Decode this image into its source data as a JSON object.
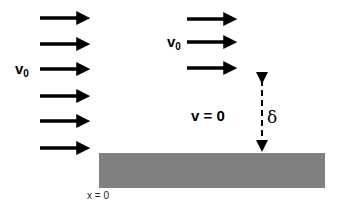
{
  "diagram": {
    "title": "",
    "colors": {
      "arrow": "#000000",
      "plate": "#808080",
      "background": "#ffffff"
    },
    "free_stream_arrows": {
      "left_column": {
        "x_start": 40,
        "x_end": 90,
        "y": [
          18,
          44,
          69,
          96,
          121,
          148
        ]
      },
      "right_column": {
        "x_start": 187,
        "x_end": 237,
        "y": [
          19,
          42,
          68
        ]
      }
    },
    "labels": {
      "v0_left": {
        "text": "v",
        "subscript": "0"
      },
      "v0_right": {
        "text": "v",
        "subscript": "0"
      },
      "v_zero": "v = 0",
      "delta": "δ",
      "x_zero": "x = 0"
    },
    "plate": {
      "x": 99,
      "y": 153,
      "width": 226,
      "height": 35
    },
    "thickness_arrow": {
      "x": 262,
      "y_top": 75,
      "y_bottom": 153,
      "style": "dashed",
      "heads": "both"
    }
  }
}
